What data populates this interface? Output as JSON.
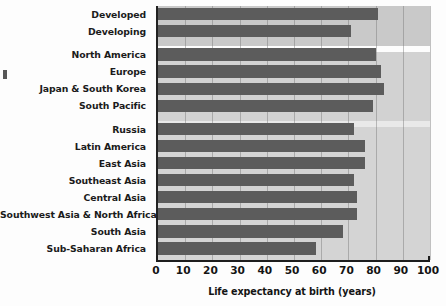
{
  "chart_data": {
    "type": "bar",
    "orientation": "horizontal",
    "title": "",
    "xlabel": "Life expectancy at birth (years)",
    "ylabel": "",
    "xlim": [
      0,
      100
    ],
    "xticks": [
      0,
      10,
      20,
      30,
      40,
      50,
      60,
      70,
      80,
      90,
      100
    ],
    "grid": true,
    "legend": null,
    "categories": [
      "Developed",
      "Developing",
      "North America",
      "Europe",
      "Japan & South Korea",
      "South Pacific",
      "Russia",
      "Latin America",
      "East Asia",
      "Southeast Asia",
      "Central Asia",
      "Southwest Asia & North Africa",
      "South Asia",
      "Sub-Saharan Africa"
    ],
    "values": [
      81,
      71,
      80,
      82,
      83,
      79,
      72,
      76,
      76,
      72,
      73,
      73,
      68,
      58
    ],
    "groups": [
      {
        "name": "development-level",
        "categories": [
          "Developed",
          "Developing"
        ]
      },
      {
        "name": "high-income-regions",
        "categories": [
          "North America",
          "Europe",
          "Japan & South Korea",
          "South Pacific"
        ]
      },
      {
        "name": "other-regions",
        "categories": [
          "Russia",
          "Latin America",
          "East Asia",
          "Southeast Asia",
          "Central Asia",
          "Southwest Asia & North Africa",
          "South Asia",
          "Sub-Saharan Africa"
        ]
      }
    ],
    "colors": {
      "bar": "#5c5c5c",
      "plot_background": "#d4d4d4",
      "plot_background_top_band": "#c9c9c9",
      "gridline": "#787878",
      "axis": "#1d1d1d",
      "text": "#141414",
      "page_background": "#fdfdfd"
    }
  }
}
